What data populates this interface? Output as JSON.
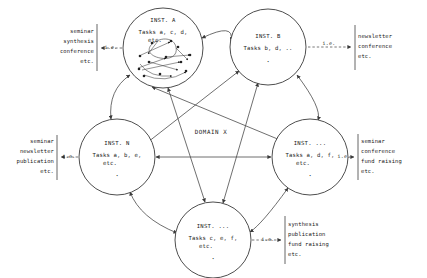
{
  "diagram": {
    "center_label": "DOMAIN X",
    "ie_label": "i.e.",
    "colors": {
      "stroke": "#4a4a4a",
      "node_stroke": "#3a3a3a",
      "text": "#1a1a1a",
      "background": "#ffffff"
    }
  },
  "nodes": [
    {
      "id": "inst-a",
      "title": "INST. A",
      "tasks": "Tasks a, c, d,",
      "tasks_cont": "etc.",
      "dots": "",
      "cx": 163,
      "cy": 48,
      "r": 40,
      "has_internal_network": true
    },
    {
      "id": "inst-b",
      "title": "INST. B",
      "tasks": "Tasks b, d, ..",
      "tasks_cont": "",
      "dots": "·",
      "cx": 268,
      "cy": 47,
      "r": 38,
      "has_internal_network": false
    },
    {
      "id": "inst-right",
      "title": "INST. ...",
      "tasks": "Tasks a, d, f,",
      "tasks_cont": "etc.",
      "dots": "·",
      "cx": 310,
      "cy": 157,
      "r": 38,
      "has_internal_network": false
    },
    {
      "id": "inst-bottom",
      "title": "INST. ...",
      "tasks": "Tasks c, e, f,",
      "tasks_cont": "etc.",
      "dots": "·",
      "cx": 213,
      "cy": 240,
      "r": 38,
      "has_internal_network": false
    },
    {
      "id": "inst-n",
      "title": "INST. N",
      "tasks": "Tasks a, b, e,",
      "tasks_cont": "etc.",
      "dots": "·",
      "cx": 117,
      "cy": 157,
      "r": 38,
      "has_internal_network": false
    }
  ],
  "outputs": [
    {
      "id": "output-top-left",
      "from": "inst-a",
      "ie": "i.e.",
      "align": "right",
      "lines": [
        "seminar",
        "synthesis",
        "conference",
        "etc."
      ]
    },
    {
      "id": "output-top-right",
      "from": "inst-b",
      "ie": "i.e.",
      "align": "left",
      "lines": [
        "newsletter",
        "conference",
        "etc."
      ]
    },
    {
      "id": "output-mid-left",
      "from": "inst-n",
      "ie": "i.e.",
      "align": "right",
      "lines": [
        "seminar",
        "newsletter",
        "publication",
        "etc."
      ]
    },
    {
      "id": "output-mid-right",
      "from": "inst-right",
      "ie": "i.e.",
      "align": "left",
      "lines": [
        "seminar",
        "conference",
        "fund raising",
        "etc."
      ]
    },
    {
      "id": "output-bottom-right",
      "from": "inst-bottom",
      "ie": "i.e.",
      "align": "left",
      "lines": [
        "synthesis",
        "publication",
        "fund raising",
        "etc."
      ]
    }
  ]
}
